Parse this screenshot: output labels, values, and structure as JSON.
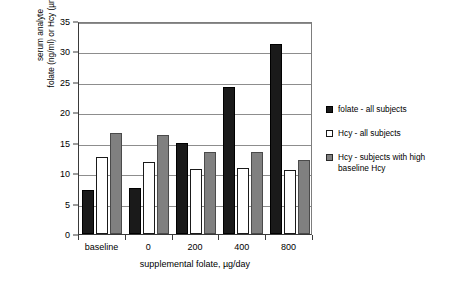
{
  "chart_data": {
    "type": "bar",
    "title": "",
    "categories": [
      "baseline",
      "0",
      "200",
      "400",
      "800"
    ],
    "series": [
      {
        "name": "folate - all subjects",
        "color": "#1a1a1a",
        "values": [
          7.2,
          7.5,
          15.0,
          24.2,
          31.2
        ]
      },
      {
        "name": "Hcy - all subjects",
        "color": "#ffffff",
        "values": [
          12.6,
          11.8,
          10.7,
          10.8,
          10.5
        ]
      },
      {
        "name": "Hcy - subjects with high baseline Hcy",
        "color": "#808080",
        "values": [
          16.6,
          16.3,
          13.4,
          13.4,
          12.2
        ]
      }
    ],
    "xlabel": "supplemental folate, µg/day",
    "ylabel": "serum analyte\nfolate (ng/ml) or Hcy (µmol/l)",
    "ylim": [
      0,
      35
    ],
    "yticks": [
      0,
      5,
      10,
      15,
      20,
      25,
      30,
      35
    ],
    "ytick_labels": [
      "0",
      "5",
      "10",
      "15",
      "20",
      "25",
      "30",
      "35"
    ],
    "grid": "horizontal",
    "legend_position": "right"
  },
  "legend": {
    "items": [
      {
        "label": "folate - all subjects",
        "marker": "filled-square-black"
      },
      {
        "label": "Hcy - all subjects",
        "marker": "open-square-white"
      },
      {
        "label": "Hcy - subjects with high baseline Hcy",
        "marker": "filled-square-gray"
      }
    ]
  }
}
